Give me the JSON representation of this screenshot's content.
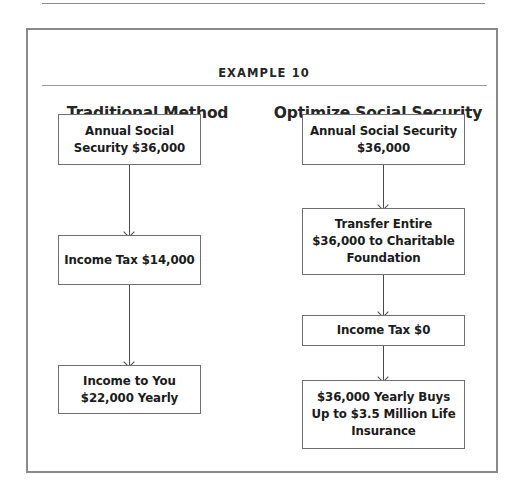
{
  "page": {
    "background": "#ffffff",
    "rule_color": "#8d8d8f"
  },
  "frame": {
    "border_color": "#8a8a8c",
    "title": "EXAMPLE 10"
  },
  "columns": [
    {
      "id": "traditional",
      "heading": "Traditional Method",
      "nodes": [
        {
          "id": "trad-1",
          "text": "Annual Social Security $36,000"
        },
        {
          "id": "trad-2",
          "text": "Income Tax $14,000"
        },
        {
          "id": "trad-3",
          "text": "Income to You $22,000 Yearly"
        }
      ],
      "connectors": [
        "arrow-down",
        "arrow-down"
      ]
    },
    {
      "id": "optimized",
      "heading": "Optimize Social Security",
      "nodes": [
        {
          "id": "opt-1",
          "text": "Annual Social Security $36,000"
        },
        {
          "id": "opt-2",
          "text": "Transfer Entire $36,000 to Charitable Foundation"
        },
        {
          "id": "opt-3",
          "text": "Income Tax $0"
        },
        {
          "id": "opt-4",
          "text": "$36,000 Yearly Buys Up to $3.5 Million Life Insurance"
        }
      ],
      "connectors": [
        "arrow-down",
        "arrow-down",
        "arrow-down"
      ]
    }
  ]
}
